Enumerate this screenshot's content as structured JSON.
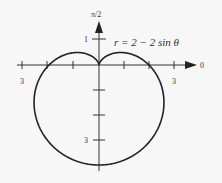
{
  "chart_data": {
    "type": "line",
    "subtype": "polar",
    "title": "",
    "equation_label": "r = 2 − 2 sin θ",
    "equation": {
      "a": 2,
      "b": -2,
      "func": "sin"
    },
    "axis_labels": {
      "polar_axis": "0",
      "vertical_axis": "π/2"
    },
    "tick_labels": [
      {
        "position": "left-horizontal",
        "value": "3"
      },
      {
        "position": "right-horizontal",
        "value": "3"
      },
      {
        "position": "upper-vertical",
        "value": "1"
      },
      {
        "position": "lower-vertical",
        "value": "3"
      }
    ],
    "horizontal_ticks": [
      -3,
      -2,
      -1,
      1,
      2,
      3
    ],
    "vertical_ticks": [
      1,
      -1,
      -2,
      -3
    ],
    "xlim": [
      -3,
      3.8
    ],
    "ylim": [
      -4.2,
      1.7
    ],
    "grid": false,
    "points_note": "cardioid: cusp at origin, crosses polar axis at r=2 (θ=0, π), maximum r=4 at θ=3π/2"
  },
  "labels": {
    "equation": "r = 2 − 2 sin θ",
    "axis_zero": "0",
    "axis_pi2": "π/2",
    "tick_left_3": "3",
    "tick_right_3": "3",
    "tick_up_1": "1",
    "tick_down_3": "3"
  },
  "colors": {
    "curve": "#222222",
    "axis": "#333333",
    "background": "#f7f7f7"
  }
}
